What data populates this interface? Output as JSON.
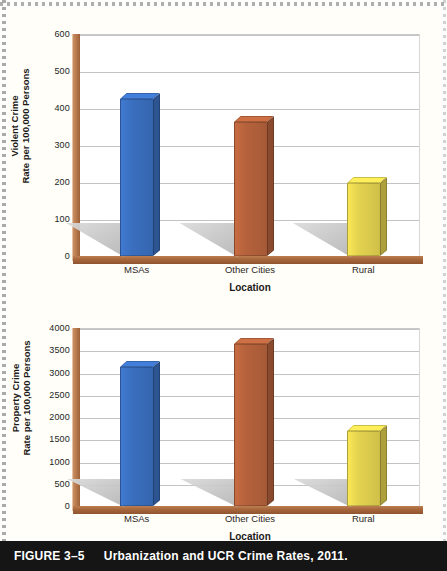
{
  "figure": {
    "caption_number": "FIGURE 3–5",
    "caption_title": "Urbanization and UCR Crime Rates, 2011."
  },
  "colors": {
    "bar_msas": "#3a6fbf",
    "bar_other_cities": "#b5623c",
    "bar_rural": "#e3d24f",
    "axis_brown": "#a8673c",
    "gridline": "#c3c3c3",
    "shadow_gray": "#c6c6c6",
    "caption_bar": "#151515"
  },
  "chart_data": [
    {
      "type": "bar",
      "title": "Violent Crime Rate per 100,000 Persons by Location, 2011",
      "categories": [
        "MSAs",
        "Other Cities",
        "Rural"
      ],
      "values": [
        425,
        362,
        197
      ],
      "xlabel": "Location",
      "ylabel": "Violent Crime\nRate per 100,000 Persons",
      "ylabel_line1": "Violent Crime",
      "ylabel_line2": "Rate per 100,000 Persons",
      "ylim": [
        0,
        600
      ],
      "ytick_step": 100,
      "yticks": [
        0,
        100,
        200,
        300,
        400,
        500,
        600
      ],
      "ytick_labels": [
        "0",
        "100",
        "200",
        "300",
        "400",
        "500",
        "600"
      ],
      "grid": true,
      "legend": "none"
    },
    {
      "type": "bar",
      "title": "Property Crime Rate per 100,000 Persons by Location, 2011",
      "categories": [
        "MSAs",
        "Other Cities",
        "Rural"
      ],
      "values": [
        3120,
        3630,
        1690
      ],
      "xlabel": "Location",
      "ylabel": "Property Crime\nRate per 100,000 Persons",
      "ylabel_line1": "Property Crime",
      "ylabel_line2": "Rate per 100,000 Persons",
      "ylim": [
        0,
        4000
      ],
      "ytick_step": 500,
      "yticks": [
        0,
        500,
        1000,
        1500,
        2000,
        2500,
        3000,
        3500,
        4000
      ],
      "ytick_labels": [
        "0",
        "500",
        "1000",
        "1500",
        "2000",
        "2500",
        "3000",
        "3500",
        "4000"
      ],
      "grid": true,
      "legend": "none"
    }
  ]
}
